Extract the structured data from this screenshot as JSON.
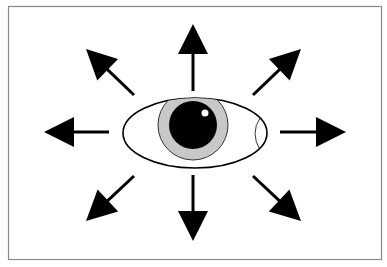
{
  "diagram": {
    "colors": {
      "background": "#ffffff",
      "frame": "#8a8a8a",
      "arrow": "#000000",
      "sclera": "#ffffff",
      "iris": "#c8c8c8",
      "pupil": "#000000",
      "highlight": "#ffffff"
    },
    "eye": {
      "center": [
        195,
        133
      ],
      "rx": 72,
      "ry": 35,
      "iris": {
        "cx": 193,
        "cy": 125,
        "r": 35
      },
      "pupil": {
        "cx": 193,
        "cy": 125,
        "r": 24
      },
      "highlight": {
        "cx": 205,
        "cy": 113,
        "r": 3.5
      }
    },
    "arrows": [
      {
        "direction": "up",
        "tail": [
          193,
          91
        ],
        "tip": [
          193,
          24
        ]
      },
      {
        "direction": "up-right",
        "tail": [
          253,
          95
        ],
        "tip": [
          301,
          49
        ]
      },
      {
        "direction": "right",
        "tail": [
          280,
          132
        ],
        "tip": [
          346,
          132
        ]
      },
      {
        "direction": "down-right",
        "tail": [
          253,
          176
        ],
        "tip": [
          301,
          221
        ]
      },
      {
        "direction": "down",
        "tail": [
          193,
          175
        ],
        "tip": [
          193,
          241
        ]
      },
      {
        "direction": "down-left",
        "tail": [
          134,
          176
        ],
        "tip": [
          86,
          221
        ]
      },
      {
        "direction": "left",
        "tail": [
          109,
          132
        ],
        "tip": [
          44,
          132
        ]
      },
      {
        "direction": "up-left",
        "tail": [
          134,
          95
        ],
        "tip": [
          86,
          49
        ]
      }
    ]
  }
}
